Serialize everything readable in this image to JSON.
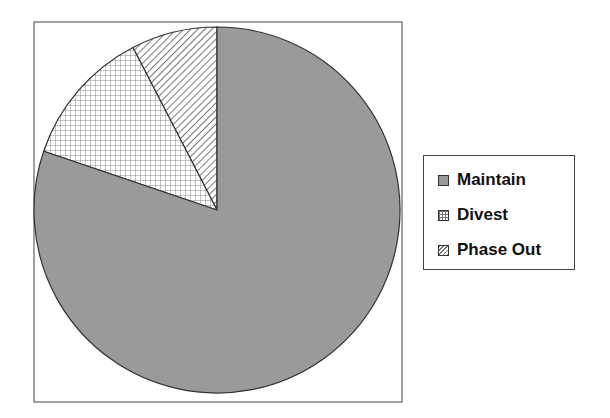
{
  "chart_data": {
    "type": "pie",
    "title": "",
    "categories": [
      "Maintain",
      "Divest",
      "Phase Out"
    ],
    "values": [
      80.2,
      12.2,
      7.6
    ],
    "unit": "percent (estimated)",
    "start_angle": "12 o'clock, counterclockwise",
    "draw_order": [
      "Phase Out",
      "Divest",
      "Maintain"
    ],
    "fills": {
      "Maintain": {
        "pattern": "solid",
        "color": "#9a9a9a"
      },
      "Divest": {
        "pattern": "grid",
        "color": "#777777"
      },
      "Phase Out": {
        "pattern": "diagonal-hatch",
        "color": "#777777"
      }
    },
    "legend_position": "right"
  },
  "legend": {
    "items": [
      {
        "label": "Maintain"
      },
      {
        "label": "Divest"
      },
      {
        "label": "Phase Out"
      }
    ]
  }
}
